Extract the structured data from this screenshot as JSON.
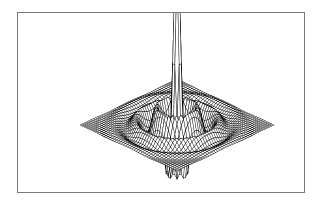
{
  "figure": {
    "title": "",
    "caption": "3D wireframe mesh surface plot of a radially symmetric damped oscillatory function with a sharp central spike",
    "background_color": "#ffffff"
  },
  "frame": {
    "name": "plot-border",
    "left": 17,
    "top": 12,
    "right": 305,
    "bottom": 193,
    "border_color": "#7a7a7a",
    "border_width": 1,
    "fill_color": "#ffffff"
  },
  "chart_data": {
    "type": "line",
    "render_style": "wireframe-mesh-surface",
    "title": "",
    "subtitle": "",
    "xlabel": "",
    "ylabel": "",
    "zlabel": "",
    "grid": false,
    "legend": null,
    "axes_visible": false,
    "tick_labels": [],
    "annotations": [],
    "line_color": "#000000",
    "line_width": 0.5,
    "surface_fill": "#ffffff",
    "hidden_line_removal": true,
    "projection": {
      "type": "parallel-oblique",
      "azimuth_deg": -37.5,
      "elevation_deg": 24,
      "center_x": 177,
      "center_y": 125,
      "half_width": 130,
      "row_step_x": 2.15,
      "row_step_y": 1.02,
      "col_step_x": 2.15,
      "col_step_y": -1.02,
      "z_scale": 112
    },
    "function": {
      "name": "damped-radial-oscillation",
      "expression": "z = exp(-a*r^2) * cos(k*r) * decay(r)",
      "radial_frequency_k": 2.35,
      "gaussian_decay_a": 0.055,
      "spike_sharpness": 7.0,
      "spike_amplitude": 1.0,
      "ripple_amplitude": 0.17
    },
    "grid_resolution": {
      "rows": 46,
      "cols": 46
    },
    "domain": {
      "x": [
        -8.5,
        8.5
      ],
      "y": [
        -8.5,
        8.5
      ]
    },
    "zlim": [
      -0.42,
      1.0
    ],
    "extent_px": {
      "surface_left": 32,
      "surface_right": 292,
      "peak_x": 177,
      "peak_y": 14,
      "trough_bottom_y": 192,
      "mid_plane_y": 125
    },
    "series": [
      {
        "name": "mesh-rows",
        "count": 46,
        "orientation": "row"
      },
      {
        "name": "mesh-cols",
        "count": 46,
        "orientation": "column"
      }
    ]
  }
}
